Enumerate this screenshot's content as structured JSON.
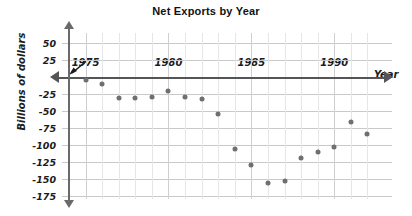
{
  "title": "Net Exports by Year",
  "axis": {
    "y_title": "Billions of dollars",
    "x_title": "Year",
    "y_ticks": [
      "50",
      "25",
      "-25",
      "-50",
      "-75",
      "-100",
      "-125",
      "-150",
      "-175"
    ],
    "x_ticks": [
      "1975",
      "1980",
      "1985",
      "1990"
    ]
  },
  "colors": {
    "point": "#6e6e73",
    "axis": "#555558",
    "grid": "#c9c9cc",
    "text": "#1c1c1c"
  },
  "chart_data": {
    "type": "scatter",
    "title": "Net Exports by Year",
    "xlabel": "Year",
    "ylabel": "Billions of dollars",
    "xlim": [
      1974,
      1993
    ],
    "ylim": [
      -175,
      50
    ],
    "ytick_values": [
      50,
      25,
      0,
      -25,
      -50,
      -75,
      -100,
      -125,
      -150,
      -175
    ],
    "ytick_labels": [
      "50",
      "25",
      "",
      "-25",
      "-50",
      "-75",
      "-100",
      "-125",
      "-150",
      "-175"
    ],
    "xtick_values": [
      1975,
      1980,
      1985,
      1990
    ],
    "xtick_labels": [
      "1975",
      "1980",
      "1985",
      "1990"
    ],
    "grid": true,
    "legend": "none",
    "x": [
      1975,
      1976,
      1977,
      1978,
      1979,
      1980,
      1981,
      1982,
      1983,
      1984,
      1985,
      1986,
      1987,
      1988,
      1989,
      1990,
      1991,
      1992
    ],
    "values": [
      -5,
      -11,
      -31,
      -31,
      -29,
      -21,
      -29,
      -33,
      -55,
      -106,
      -130,
      -156,
      -153,
      -119,
      -111,
      -103,
      -66,
      -84
    ],
    "points": [
      {
        "year": 1975,
        "value": -5
      },
      {
        "year": 1976,
        "value": -11
      },
      {
        "year": 1977,
        "value": -31
      },
      {
        "year": 1978,
        "value": -31
      },
      {
        "year": 1979,
        "value": -29
      },
      {
        "year": 1980,
        "value": -21
      },
      {
        "year": 1981,
        "value": -29
      },
      {
        "year": 1982,
        "value": -33
      },
      {
        "year": 1983,
        "value": -55
      },
      {
        "year": 1984,
        "value": -106
      },
      {
        "year": 1985,
        "value": -130
      },
      {
        "year": 1986,
        "value": -156
      },
      {
        "year": 1987,
        "value": -153
      },
      {
        "year": 1988,
        "value": -119
      },
      {
        "year": 1989,
        "value": -111
      },
      {
        "year": 1990,
        "value": -103
      },
      {
        "year": 1991,
        "value": -66
      },
      {
        "year": 1992,
        "value": -84
      }
    ]
  }
}
